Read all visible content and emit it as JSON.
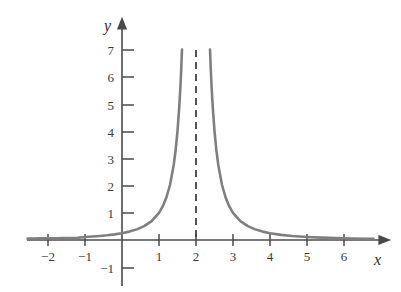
{
  "chart_data": {
    "type": "line",
    "title": "",
    "subtitle": "",
    "xlabel": "x",
    "ylabel": "y",
    "function": "y = 1/(x - 2)^2",
    "xlim": [
      -2.6,
      6.8
    ],
    "ylim": [
      -1.6,
      7.9
    ],
    "grid": false,
    "legend": null,
    "x_ticks": [
      -2,
      -1,
      1,
      2,
      3,
      4,
      5,
      6
    ],
    "x_tick_labels": [
      "−2",
      "−1",
      "1",
      "2",
      "3",
      "4",
      "5",
      "6"
    ],
    "y_ticks": [
      -1,
      1,
      2,
      3,
      4,
      5,
      6,
      7
    ],
    "y_tick_labels": [
      "−1",
      "1",
      "2",
      "3",
      "4",
      "5",
      "6",
      "7"
    ],
    "curve_color": "#7f7f7f",
    "axis_color": "#4a4a4a",
    "asymptote": {
      "type": "vertical",
      "x": 2,
      "style": "dashed",
      "color": "#3a3a3a"
    },
    "series": [
      {
        "name": "left branch",
        "x": [
          -2.55,
          -2.4,
          -2.2,
          -2.0,
          -1.8,
          -1.6,
          -1.4,
          -1.2,
          -1.0,
          -0.8,
          -0.6,
          -0.4,
          -0.2,
          0.0,
          0.2,
          0.4,
          0.6,
          0.8,
          1.0,
          1.1,
          1.2,
          1.3,
          1.4,
          1.45,
          1.5,
          1.55,
          1.58,
          1.6,
          1.615,
          1.622
        ],
        "values": [
          0.0494,
          0.0533,
          0.0586,
          0.0625,
          0.0657,
          0.0694,
          0.0735,
          0.0781,
          0.1111,
          0.1276,
          0.1479,
          0.1736,
          0.2066,
          0.25,
          0.3086,
          0.3906,
          0.5102,
          0.6944,
          1.0,
          1.2346,
          1.5625,
          2.0408,
          2.7778,
          3.3058,
          4.0,
          4.9383,
          5.6689,
          6.25,
          6.7928,
          7.0
        ]
      },
      {
        "name": "right branch",
        "x": [
          2.378,
          2.385,
          2.4,
          2.42,
          2.45,
          2.5,
          2.55,
          2.6,
          2.7,
          2.8,
          2.9,
          3.0,
          3.2,
          3.4,
          3.6,
          3.8,
          4.0,
          4.3,
          4.6,
          5.0,
          5.4,
          5.8,
          6.2,
          6.6,
          6.8
        ],
        "values": [
          7.0,
          6.7928,
          6.25,
          5.6689,
          4.9383,
          4.0,
          3.3058,
          2.7778,
          2.0408,
          1.5625,
          1.2346,
          1.0,
          0.6944,
          0.5102,
          0.3906,
          0.3086,
          0.25,
          0.189,
          0.1479,
          0.1111,
          0.0857,
          0.0675,
          0.0544,
          0.0447,
          0.0408
        ]
      }
    ]
  },
  "axes_labels": {
    "x_axis_name": "x",
    "y_axis_name": "y"
  }
}
